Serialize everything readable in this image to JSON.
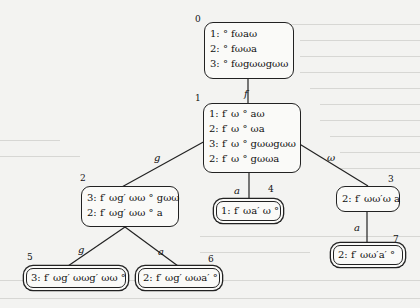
{
  "nodes": [
    {
      "id": "0",
      "lines": [
        "1: ° fωaω",
        "2: ° fωωa",
        "3: ° fωgωωgωω"
      ]
    },
    {
      "id": "1",
      "lines": [
        "1: f′ ω ° aω",
        "2: f′ ω ° ωa",
        "3: f′ ω ° gωωgωω",
        "2: f′ ω ° gωωa"
      ]
    },
    {
      "id": "2",
      "lines": [
        "3: f′ ωg′ ωω ° gωω",
        "2: f′ ωg′ ωω ° a"
      ]
    },
    {
      "id": "3",
      "lines": [
        "2: f′ ωω′ω a"
      ]
    },
    {
      "id": "4",
      "lines": [
        "1: f′ ωa′ ω °"
      ]
    },
    {
      "id": "5",
      "lines": [
        "3: f′ ωg′ ωωg′ ωω °"
      ]
    },
    {
      "id": "6",
      "lines": [
        "2: f′ ωg′ ωωa′ °"
      ]
    },
    {
      "id": "7",
      "lines": [
        "2: f′ ωω′a′ °"
      ]
    }
  ],
  "edges": [
    {
      "from": "0",
      "to": "1",
      "label": "f"
    },
    {
      "from": "1",
      "to": "2",
      "label": "g"
    },
    {
      "from": "1",
      "to": "4",
      "label": "a"
    },
    {
      "from": "1",
      "to": "3",
      "label": "ω"
    },
    {
      "from": "2",
      "to": "5",
      "label": "g"
    },
    {
      "from": "2",
      "to": "6",
      "label": "a"
    },
    {
      "from": "3",
      "to": "7",
      "label": "a"
    }
  ]
}
